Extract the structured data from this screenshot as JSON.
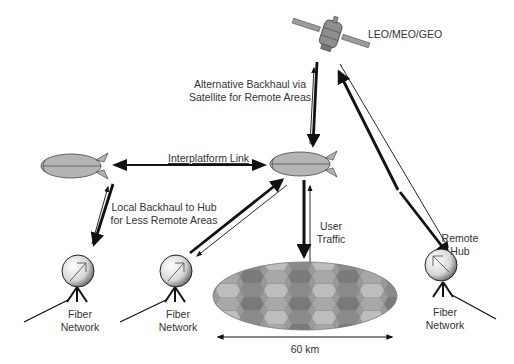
{
  "diagram": {
    "satellite": {
      "label": "LEO/MEO/GEO"
    },
    "links": {
      "alt_backhaul": {
        "line1": "Alternative Backhaul via",
        "line2": "Satellite for Remote Areas"
      },
      "interplatform": {
        "label": "Interplatform Link"
      },
      "local_backhaul": {
        "line1": "Local Backhaul to Hub",
        "line2": "for Less Remote Areas"
      },
      "user_traffic": {
        "line1": "User",
        "line2": "Traffic"
      }
    },
    "ground_stations": [
      {
        "line1": "Fiber",
        "line2": "Network"
      },
      {
        "line1": "Fiber",
        "line2": "Network"
      },
      {
        "line1": "Fiber",
        "line2": "Network",
        "hub_line1": "Remote",
        "hub_line2": "Hub"
      }
    ],
    "coverage": {
      "diameter_label": "60 km"
    },
    "colors": {
      "airship": "#b4b4b4",
      "cell_dark": "#7a7a7a",
      "cell_mid": "#9a9a9a",
      "cell_light": "#bdbdbd",
      "arrow": "#111111"
    }
  }
}
